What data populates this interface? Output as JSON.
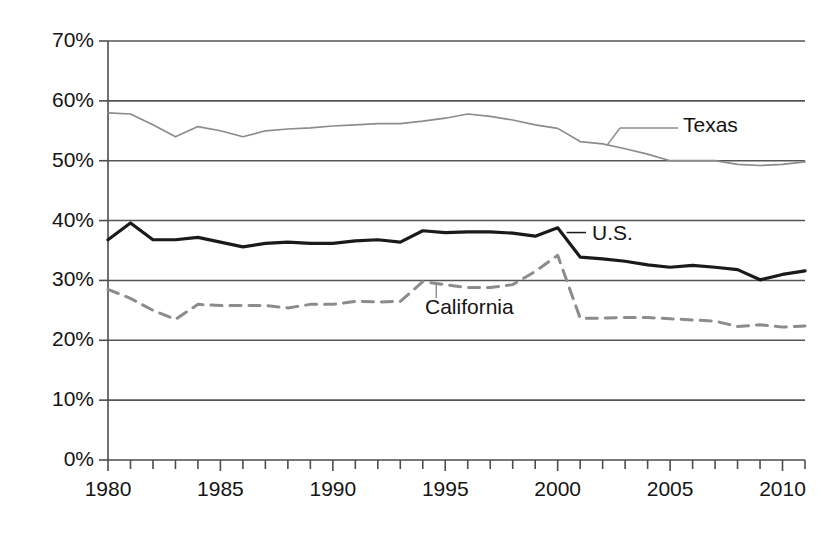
{
  "chart_data": {
    "type": "line",
    "title": "",
    "subtitle": "",
    "xlabel": "",
    "ylabel": "",
    "xlim": [
      1980,
      2011
    ],
    "ylim": [
      0,
      70
    ],
    "grid": "horizontal",
    "legend_position": "inline-annotations",
    "x_tick_labels": [
      "1980",
      "1985",
      "1990",
      "1995",
      "2000",
      "2005",
      "2010"
    ],
    "x_tick_values": [
      1980,
      1985,
      1990,
      1995,
      2000,
      2005,
      2010
    ],
    "x_minor_tick_interval": 1,
    "y_tick_labels": [
      "0%",
      "10%",
      "20%",
      "30%",
      "40%",
      "50%",
      "60%",
      "70%"
    ],
    "y_tick_values": [
      0,
      10,
      20,
      30,
      40,
      50,
      60,
      70
    ],
    "x": [
      1980,
      1981,
      1982,
      1983,
      1984,
      1985,
      1986,
      1987,
      1988,
      1989,
      1990,
      1991,
      1992,
      1993,
      1994,
      1995,
      1996,
      1997,
      1998,
      1999,
      2000,
      2001,
      2002,
      2003,
      2004,
      2005,
      2006,
      2007,
      2008,
      2009,
      2010,
      2011
    ],
    "series": [
      {
        "name": "Texas",
        "style": "thin-solid",
        "color": "#8c8c8c",
        "values": [
          58.0,
          57.8,
          56.0,
          54.0,
          55.7,
          55.0,
          54.0,
          55.0,
          55.3,
          55.5,
          55.8,
          56.0,
          56.2,
          56.2,
          56.6,
          57.1,
          57.8,
          57.4,
          56.8,
          56.0,
          55.4,
          53.2,
          52.8,
          52.0,
          51.1,
          50.0,
          50.0,
          50.0,
          49.4,
          49.2,
          49.4,
          49.8
        ],
        "label_position": {
          "x": 683,
          "y": 126
        }
      },
      {
        "name": "U.S.",
        "style": "thick-solid",
        "color": "#1a1a1a",
        "values": [
          36.8,
          39.6,
          36.8,
          36.8,
          37.2,
          36.4,
          35.6,
          36.2,
          36.4,
          36.2,
          36.2,
          36.6,
          36.8,
          36.4,
          38.3,
          38.0,
          38.1,
          38.1,
          37.9,
          37.4,
          38.8,
          33.9,
          33.6,
          33.2,
          32.6,
          32.2,
          32.5,
          32.2,
          31.8,
          30.1,
          31.0,
          31.6
        ],
        "label_position": {
          "x": 592,
          "y": 234
        }
      },
      {
        "name": "California",
        "style": "dashed",
        "color": "#8c8c8c",
        "values": [
          28.5,
          27.0,
          25.0,
          23.5,
          26.0,
          25.8,
          25.8,
          25.8,
          25.4,
          26.0,
          26.0,
          26.5,
          26.4,
          26.5,
          29.8,
          29.3,
          28.8,
          28.8,
          29.3,
          31.5,
          34.2,
          23.7,
          23.7,
          23.8,
          23.8,
          23.6,
          23.4,
          23.2,
          22.3,
          22.6,
          22.2,
          22.4
        ],
        "label_position": {
          "x": 425,
          "y": 308
        }
      }
    ],
    "annotations": [
      {
        "text": "Texas",
        "kind": "series-callout"
      },
      {
        "text": "U.S.",
        "kind": "series-callout"
      },
      {
        "text": "California",
        "kind": "series-callout"
      }
    ]
  },
  "axes": {
    "y_labels": [
      "70%",
      "60%",
      "50%",
      "40%",
      "30%",
      "20%",
      "10%",
      "0%"
    ],
    "x_labels": [
      "1980",
      "1985",
      "1990",
      "1995",
      "2000",
      "2005",
      "2010"
    ]
  },
  "labels": {
    "texas": "Texas",
    "us": "U.S.",
    "california": "California"
  },
  "colors": {
    "axis": "#4d4d4d",
    "grid": "#555555",
    "us_line": "#1a1a1a",
    "texas_line": "#8c8c8c",
    "california_line": "#8c8c8c",
    "text": "#141414",
    "background": "#ffffff"
  }
}
